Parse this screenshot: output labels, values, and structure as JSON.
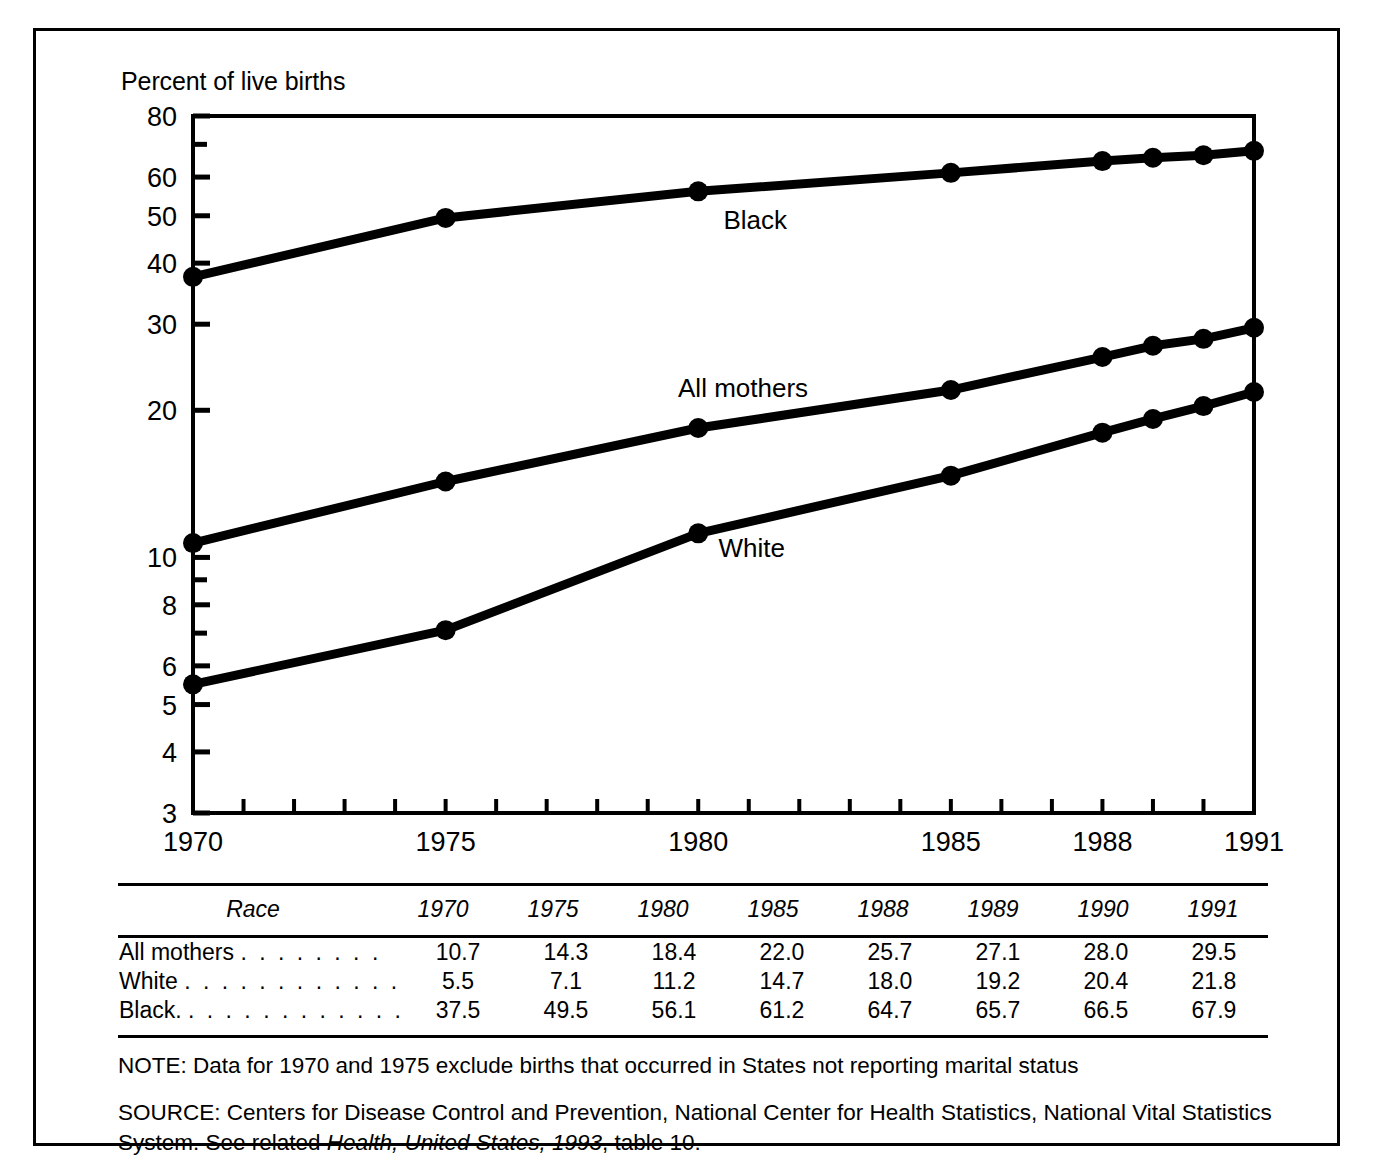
{
  "chart_data": {
    "type": "line",
    "title": "",
    "subtitle": "",
    "xlabel": "",
    "ylabel": "Percent of live births",
    "x": [
      1970,
      1975,
      1980,
      1985,
      1988,
      1989,
      1990,
      1991
    ],
    "xlim": [
      1970,
      1991
    ],
    "ylim": [
      3,
      80
    ],
    "yscale": "log",
    "grid": false,
    "legend_position": "inline-annotations",
    "ytick_labels": [
      "80",
      "60",
      "50",
      "40",
      "30",
      "20",
      "10",
      "8",
      "6",
      "5",
      "4",
      "3"
    ],
    "ytick_values": [
      80,
      60,
      50,
      40,
      30,
      20,
      10,
      8,
      6,
      5,
      4,
      3
    ],
    "yminor_values": [
      70,
      9,
      7
    ],
    "xtick_labels": [
      "1970",
      "1975",
      "1980",
      "1985",
      "1988",
      "1991"
    ],
    "xtick_values": [
      1970,
      1975,
      1980,
      1985,
      1988,
      1991
    ],
    "series": [
      {
        "name": "Black",
        "values": [
          37.5,
          49.5,
          56.1,
          61.2,
          64.7,
          65.7,
          66.5,
          67.9
        ]
      },
      {
        "name": "All mothers",
        "values": [
          10.7,
          14.3,
          18.4,
          22.0,
          25.7,
          27.1,
          28.0,
          29.5
        ]
      },
      {
        "name": "White",
        "values": [
          5.5,
          7.1,
          11.2,
          14.7,
          18.0,
          19.2,
          20.4,
          21.8
        ]
      }
    ],
    "annotations": [
      {
        "text": "Black",
        "x": 1980.5,
        "y": 47.0
      },
      {
        "text": "All mothers",
        "x": 1979.6,
        "y": 21.3
      },
      {
        "text": "White",
        "x": 1980.4,
        "y": 10.0
      }
    ]
  },
  "table": {
    "headers": [
      "Race",
      "1970",
      "1975",
      "1980",
      "1985",
      "1988",
      "1989",
      "1990",
      "1991"
    ],
    "rows": [
      {
        "label": "All mothers",
        "leader": ". . . . . . . .",
        "values": [
          "10.7",
          "14.3",
          "18.4",
          "22.0",
          "25.7",
          "27.1",
          "28.0",
          "29.5"
        ]
      },
      {
        "label": "White",
        "leader": ". . . . . . . . . . . .",
        "values": [
          "5.5",
          "7.1",
          "11.2",
          "14.7",
          "18.0",
          "19.2",
          "20.4",
          "21.8"
        ]
      },
      {
        "label": "Black.",
        "leader": ". . . . . . . . . . . .",
        "values": [
          "37.5",
          "49.5",
          "56.1",
          "61.2",
          "64.7",
          "65.7",
          "66.5",
          "67.9"
        ]
      }
    ]
  },
  "notes": {
    "note": "NOTE: Data for 1970 and 1975 exclude births that occurred in States not reporting marital status",
    "source_prefix": "SOURCE: Centers for Disease Control and Prevention, National Center for Health Statistics, National Vital Statistics System. See related ",
    "source_italic": "Health, United States, 1993",
    "source_suffix": ", table 10."
  },
  "colors": {
    "line": "#000000",
    "background": "#ffffff",
    "frame": "#000000"
  }
}
